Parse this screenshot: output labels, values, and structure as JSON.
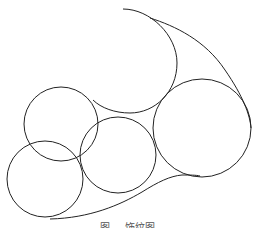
{
  "diagram": {
    "stroke_color": "#222222",
    "background": "#ffffff",
    "circles": [
      {
        "name": "top-left",
        "cx": 61,
        "cy": 124,
        "r": 37
      },
      {
        "name": "bottom-left",
        "cx": 45,
        "cy": 179,
        "r": 38
      },
      {
        "name": "middle",
        "cx": 118,
        "cy": 155,
        "r": 38
      },
      {
        "name": "right",
        "cx": 202,
        "cy": 128,
        "r": 49
      }
    ],
    "arcs": [
      {
        "name": "top-arc",
        "d": "M123,9 C150,9 177,35 177,63 C177,92 155,113 130,113 C115,113 101,108 93,100"
      },
      {
        "name": "outer-right-curve",
        "d": "M150,18 C175,26 205,40 225,70 C243,96 250,115 251,128"
      },
      {
        "name": "bottom-curve",
        "d": "M50,219 C90,218 120,205 142,192 C158,182 170,176 182,175 C190,175 196,175 200,176"
      }
    ],
    "caption": "图  ... 饰纹图"
  }
}
